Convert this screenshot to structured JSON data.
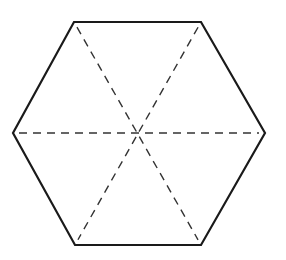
{
  "diagram": {
    "shape": "regular hexagon",
    "vertices": [
      {
        "name": "top-left",
        "x": 74,
        "y": 22
      },
      {
        "name": "top-right",
        "x": 201,
        "y": 22
      },
      {
        "name": "right",
        "x": 265,
        "y": 133
      },
      {
        "name": "bottom-right",
        "x": 201,
        "y": 245
      },
      {
        "name": "bottom-left",
        "x": 75,
        "y": 245
      },
      {
        "name": "left",
        "x": 13,
        "y": 133
      }
    ],
    "center": {
      "x": 138,
      "y": 133
    },
    "diagonals": [
      {
        "name": "horizontal",
        "from": "left",
        "to": "right",
        "style": "dashed"
      },
      {
        "name": "top-left-to-bottom-right",
        "from": "top-left",
        "to": "bottom-right",
        "style": "dashed"
      },
      {
        "name": "top-right-to-bottom-left",
        "from": "top-right",
        "to": "bottom-left",
        "style": "dashed"
      }
    ],
    "colors": {
      "outline": "#1a1a1a",
      "diagonal": "#333333",
      "background": "#ffffff"
    }
  }
}
